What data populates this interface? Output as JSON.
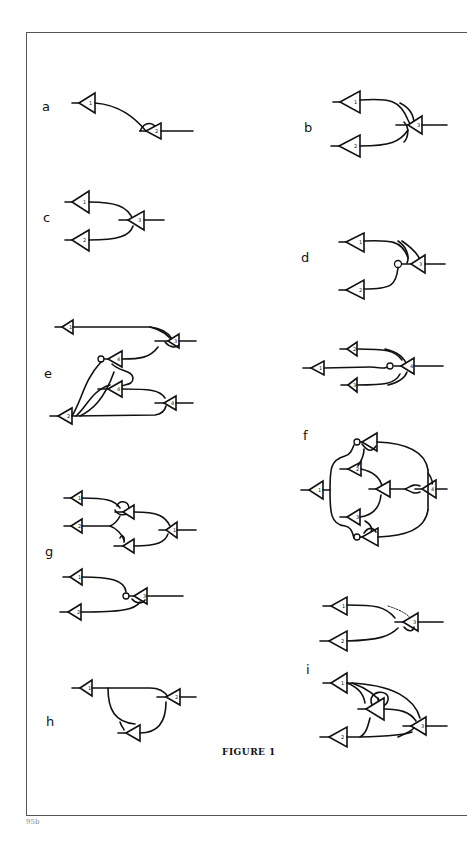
{
  "figure": {
    "caption": "FIGURE 1",
    "page_mark": "95b",
    "panels": [
      {
        "id": "a",
        "label": "a",
        "neurons": [
          "1",
          "2"
        ]
      },
      {
        "id": "b",
        "label": "b",
        "neurons": [
          "1",
          "2",
          "3"
        ]
      },
      {
        "id": "c",
        "label": "c",
        "neurons": [
          "1",
          "2",
          "3"
        ]
      },
      {
        "id": "d",
        "label": "d",
        "neurons": [
          "1",
          "2",
          "3"
        ]
      },
      {
        "id": "e",
        "label": "e",
        "neurons": [
          "1",
          "2",
          "3",
          "4",
          "4",
          "4"
        ]
      },
      {
        "id": "e2",
        "label": "",
        "neurons": [
          "1",
          "2",
          "3",
          "4"
        ]
      },
      {
        "id": "f",
        "label": "f",
        "neurons": [
          "1",
          "2",
          "3",
          "4"
        ]
      },
      {
        "id": "g",
        "label": "g",
        "neurons": [
          "1",
          "2",
          "1",
          "1",
          "2",
          "3"
        ]
      },
      {
        "id": "h",
        "label": "h",
        "neurons": [
          "1",
          "2"
        ]
      },
      {
        "id": "i_top",
        "label": "",
        "neurons": [
          "1",
          "2",
          "3"
        ]
      },
      {
        "id": "i",
        "label": "i",
        "neurons": [
          "1",
          "2",
          "3"
        ]
      }
    ]
  }
}
